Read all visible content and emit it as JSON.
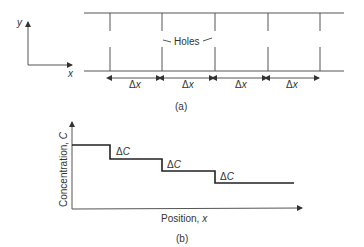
{
  "figure_a": {
    "caption": "(a)",
    "axes": {
      "x_label": "x",
      "y_label": "y"
    },
    "holes_label": "Holes",
    "delta_x_labels": [
      "Δx",
      "Δx",
      "Δx",
      "Δx"
    ],
    "delta_symbol": "Δ",
    "delta_var": "x"
  },
  "figure_b": {
    "caption": "(b)",
    "x_label": "Position, x",
    "x_label_text": "Position, ",
    "x_label_var": "x",
    "y_label_text": "Concentration, ",
    "y_label_var": "C",
    "delta_c_labels": [
      "ΔC",
      "ΔC",
      "ΔC"
    ],
    "delta_symbol": "Δ",
    "delta_var": "C"
  },
  "colors": {
    "line": "#555555",
    "stair": "#222222",
    "text": "#333333"
  }
}
